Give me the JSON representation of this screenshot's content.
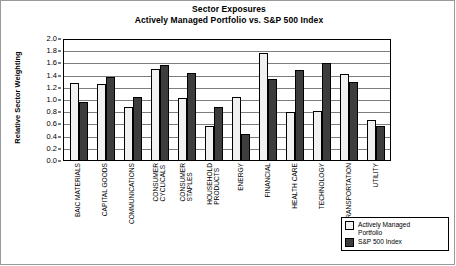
{
  "chart_data": {
    "type": "bar",
    "title": "Sector Exposures",
    "subtitle": "Actively Managed Portfolio vs. S&P 500 Index",
    "xlabel": "",
    "ylabel": "Relative Sector Weighting",
    "ylim": [
      0.0,
      2.0
    ],
    "ytick_labels": [
      "2.0",
      "1.8",
      "1.6",
      "1.4",
      "1.2",
      "1.0",
      "0.8",
      "0.6",
      "0.4",
      "0.2",
      "0.0"
    ],
    "ytick_values": [
      2.0,
      1.8,
      1.6,
      1.4,
      1.2,
      1.0,
      0.8,
      0.6,
      0.4,
      0.2,
      0.0
    ],
    "grid": true,
    "legend_position": "bottom-right",
    "categories": [
      "BAIC MATERIALS",
      "CAPITAL GOODS",
      "COMMUNICATIONS",
      "CONSUMER CYCLICALS",
      "CONSUMER STAPLES",
      "HOUSEHOLD PRODUCTS",
      "ENERGY",
      "FINANCIAL",
      "HEALTH CARE",
      "TECHNOLOGY",
      "TRANSPORTATION",
      "UTILITY"
    ],
    "category_lines": [
      [
        "BAIC MATERIALS"
      ],
      [
        "CAPITAL GOODS"
      ],
      [
        "COMMUNICATIONS"
      ],
      [
        "CONSUMER",
        "CYCLICALS"
      ],
      [
        "CONSUMER",
        "STAPLES"
      ],
      [
        "HOUSEHOLD",
        "PRODUCTS"
      ],
      [
        "ENERGY"
      ],
      [
        "FINANCIAL"
      ],
      [
        "HEALTH CARE"
      ],
      [
        "TECHNOLOGY"
      ],
      [
        "TRANSPORTATION"
      ],
      [
        "UTILITY"
      ]
    ],
    "series": [
      {
        "name": "Actively Managed Portfolio",
        "color": "#f1f1f1",
        "values": [
          1.27,
          1.25,
          0.87,
          1.49,
          1.01,
          0.56,
          1.03,
          1.75,
          0.79,
          0.81,
          1.41,
          0.66
        ]
      },
      {
        "name": "S&P 500 Index",
        "color": "#3d3d3d",
        "values": [
          0.95,
          1.36,
          1.04,
          1.56,
          1.43,
          0.87,
          0.43,
          1.33,
          1.48,
          1.59,
          1.28,
          0.55
        ]
      }
    ]
  },
  "legend": {
    "items": [
      {
        "label": "Actively Managed\nPortfolio",
        "swatch": "s0"
      },
      {
        "label": "S&P 500 Index",
        "swatch": "s1"
      }
    ]
  }
}
